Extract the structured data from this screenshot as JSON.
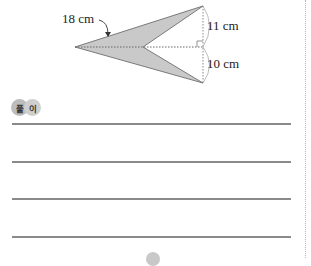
{
  "figure": {
    "shape": "arrowhead-quadrilateral",
    "fill_color": "#c9c9c9",
    "labels": {
      "length": "18 cm",
      "top_height": "11 cm",
      "bottom_height": "10 cm"
    }
  },
  "solution": {
    "badge": [
      "풀",
      "이"
    ],
    "answer_lines": 4
  }
}
